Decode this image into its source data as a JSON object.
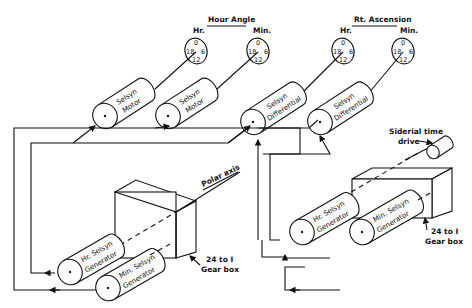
{
  "diagram": {
    "type": "schematic",
    "headers": {
      "hour_angle": "Hour Angle",
      "rt_ascension": "Rt. Ascension",
      "hr": "Hr.",
      "min": "Min."
    },
    "dial_marks": [
      "0",
      "6",
      "12",
      "18"
    ],
    "indicators": [
      {
        "group": "Hour Angle",
        "unit": "Hr.",
        "device_line1": "Selsyn",
        "device_line2": "Motor"
      },
      {
        "group": "Hour Angle",
        "unit": "Min.",
        "device_line1": "Selsyn",
        "device_line2": "Motor"
      },
      {
        "group": "Rt. Ascension",
        "unit": "Hr.",
        "device_line1": "Selsyn",
        "device_line2": "Differential"
      },
      {
        "group": "Rt. Ascension",
        "unit": "Min.",
        "device_line1": "Selsyn",
        "device_line2": "Differential"
      }
    ],
    "left_assembly": {
      "axis_label": "Polar axis",
      "gearbox_label_line1": "24 to I",
      "gearbox_label_line2": "Gear box",
      "hr_generator_line1": "Hr. Selsyn",
      "hr_generator_line2": "Generator",
      "min_generator_line1": "Min. Selsyn",
      "min_generator_line2": "Generator"
    },
    "right_assembly": {
      "drive_label_line1": "Siderial time",
      "drive_label_line2": "drive",
      "gearbox_label_line1": "24 to I",
      "gearbox_label_line2": "Gear box",
      "hr_generator_line1": "Hr. Selsyn",
      "hr_generator_line2": "Generator",
      "min_generator_line1": "Min. Selsyn",
      "min_generator_line2": "Generator"
    }
  }
}
